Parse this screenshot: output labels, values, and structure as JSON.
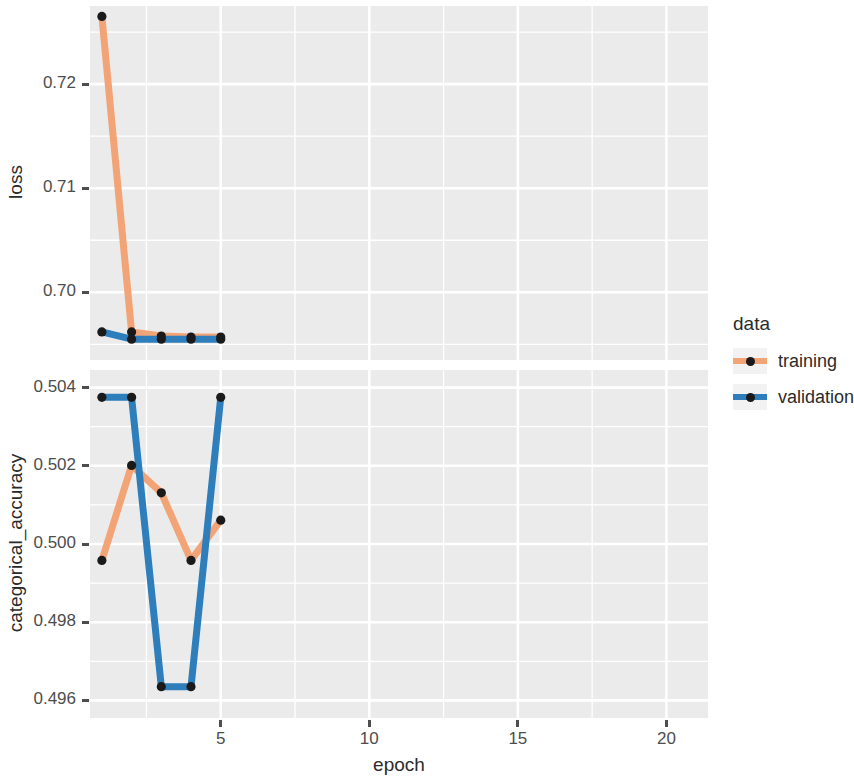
{
  "chart_data": {
    "type": "line",
    "title": "",
    "xlabel": "epoch",
    "facets": [
      {
        "name": "loss",
        "ylabel": "loss",
        "ytick_labels": [
          "0.72",
          "0.71",
          "0.70"
        ],
        "ytick_values": [
          0.72,
          0.71,
          0.7
        ],
        "ylim": [
          0.6935,
          0.7275
        ],
        "series": [
          {
            "name": "training",
            "color": "#F2A477",
            "x": [
              1,
              2,
              3,
              4,
              5
            ],
            "values": [
              0.7265,
              0.6962,
              0.6958,
              0.6957,
              0.6957
            ]
          },
          {
            "name": "validation",
            "color": "#2E7EBB",
            "x": [
              1,
              2,
              3,
              4,
              5
            ],
            "values": [
              0.6962,
              0.6955,
              0.6955,
              0.6955,
              0.6955
            ]
          }
        ]
      },
      {
        "name": "categorical_accuracy",
        "ylabel": "categorical_accuracy",
        "ytick_labels": [
          "0.504",
          "0.502",
          "0.500",
          "0.498",
          "0.496"
        ],
        "ytick_values": [
          0.504,
          0.502,
          0.5,
          0.498,
          0.496
        ],
        "ylim": [
          0.49555,
          0.50445
        ],
        "series": [
          {
            "name": "training",
            "color": "#F2A477",
            "x": [
              1,
              2,
              3,
              4,
              5
            ],
            "values": [
              0.49958,
              0.50201,
              0.50131,
              0.49958,
              0.50061
            ]
          },
          {
            "name": "validation",
            "color": "#2E7EBB",
            "x": [
              1,
              2,
              3,
              4,
              5
            ],
            "values": [
              0.50375,
              0.50375,
              0.49635,
              0.49635,
              0.50375
            ]
          }
        ]
      }
    ],
    "xtick_labels": [
      "5",
      "10",
      "15",
      "20"
    ],
    "xtick_values": [
      5,
      10,
      15,
      20
    ],
    "xlim": [
      0.6,
      21.4
    ],
    "grid": true,
    "legend": {
      "position": "right",
      "title": "data",
      "entries": [
        {
          "label": "training",
          "color": "#F2A477"
        },
        {
          "label": "validation",
          "color": "#2E7EBB"
        }
      ]
    },
    "point_color": "#1a1a1a",
    "panel_background": "#EBEBEB",
    "gridline_color": "#FFFFFF"
  }
}
